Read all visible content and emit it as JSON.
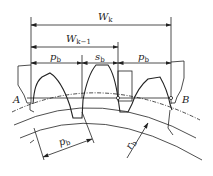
{
  "diagram": {
    "dimensions": {
      "wk": {
        "label": "W",
        "sub": "k"
      },
      "wk1": {
        "label": "W",
        "sub": "k−1"
      },
      "pb_left": {
        "label": "p",
        "sub": "b"
      },
      "sb": {
        "label": "s",
        "sub": "b"
      },
      "pb_right": {
        "label": "p",
        "sub": "b"
      },
      "pb_lower": {
        "label": "p",
        "sub": "b"
      },
      "rb": {
        "label": "r",
        "sub": "b"
      }
    },
    "points": {
      "a": "A",
      "b": "B"
    },
    "colors": {
      "line": "#222222",
      "background": "#ffffff"
    }
  }
}
